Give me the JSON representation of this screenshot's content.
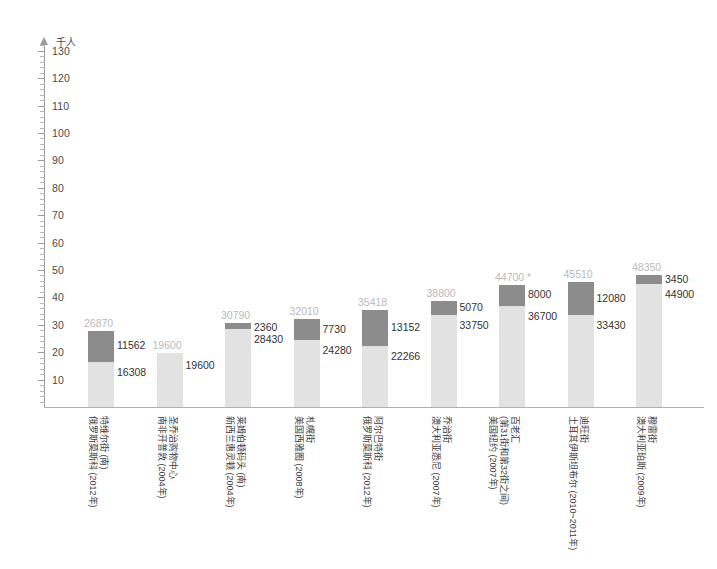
{
  "chart_data": {
    "type": "bar",
    "subtype": "stacked-bar",
    "title": "",
    "xlabel": "",
    "ylabel": "千人",
    "ylim": [
      0,
      135
    ],
    "ytick_labels": [
      "10",
      "20",
      "30",
      "40",
      "50",
      "60",
      "70",
      "80",
      "90",
      "100",
      "110",
      "120",
      "130"
    ],
    "ytick_values": [
      10,
      20,
      30,
      40,
      50,
      60,
      70,
      80,
      90,
      100,
      110,
      120,
      130
    ],
    "grid": false,
    "legend": "none",
    "unit_note": "单位：千人",
    "categories": [
      "特维尔街 / 俄罗斯莫斯科 (2012年)",
      "圣乔治购物中心 / 南非开普敦 (2004年)",
      "莱姆伯顿码头 (南) / 新西兰惠灵顿 (2004年)",
      "札幌街 / 美国西雅图 (2008年)",
      "阿尔巴特街 / 俄罗斯莫斯科 (2012年)",
      "乔治街 / 澳大利亚悉尼 (2007年)",
      "百老汇 (第31街和第32街之间) / 美国纽约 (2007年)",
      "迪旺街 / 土耳其伊斯坦布尔 (2010~2011年)",
      "穆雷街 / 澳大利亚珀斯 (2009年)"
    ],
    "series": [
      {
        "name": "上段",
        "color": "#8c8c8c",
        "values": [
          11562,
          0,
          2360,
          7730,
          13152,
          5070,
          8000,
          12080,
          3450
        ]
      },
      {
        "name": "下段",
        "color": "#e2e2e2",
        "values": [
          16308,
          19600,
          28430,
          24280,
          22266,
          33750,
          36700,
          33430,
          44900
        ]
      }
    ],
    "totals": [
      26870,
      19600,
      30790,
      32010,
      35418,
      38800,
      44700,
      45510,
      48350
    ],
    "total_label_color": "#b9b9b9",
    "annotations": [
      {
        "category_index": 6,
        "text": "*",
        "note": "asterisk next to total 44700"
      }
    ]
  },
  "axis": {
    "unit_label": "千人",
    "arrow_icon": "up-arrow-icon"
  },
  "bars": [
    {
      "name": "bar-tverskaya-moscow",
      "total": "26870",
      "total_suffix": "",
      "top_value": "11562",
      "bottom_value": "16308",
      "label_line1": "特维尔街 (南)",
      "label_line2": "俄罗斯莫斯科 (2012年)"
    },
    {
      "name": "bar-st-georges-capetown",
      "total": "19600",
      "total_suffix": "",
      "top_value": "",
      "bottom_value": "19600",
      "label_line1": "圣乔治购物中心",
      "label_line2": "南非开普敦 (2004年)"
    },
    {
      "name": "bar-lambton-wellington",
      "total": "30790",
      "total_suffix": "",
      "top_value": "2360",
      "bottom_value": "28430",
      "label_line1": "莱姆伯顿码头 (南)",
      "label_line2": "新西兰惠灵顿 (2004年)"
    },
    {
      "name": "bar-sapporo-seattle",
      "total": "32010",
      "total_suffix": "",
      "top_value": "7730",
      "bottom_value": "24280",
      "label_line1": "札幌街",
      "label_line2": "美国西雅图 (2008年)"
    },
    {
      "name": "bar-arbat-moscow",
      "total": "35418",
      "total_suffix": "",
      "top_value": "13152",
      "bottom_value": "22266",
      "label_line1": "阿尔巴特街",
      "label_line2": "俄罗斯莫斯科 (2012年)"
    },
    {
      "name": "bar-george-sydney",
      "total": "38800",
      "total_suffix": "",
      "top_value": "5070",
      "bottom_value": "33750",
      "label_line1": "乔治街",
      "label_line2": "澳大利亚悉尼 (2007年)"
    },
    {
      "name": "bar-broadway-newyork",
      "total": "44700",
      "total_suffix": "*",
      "top_value": "8000",
      "bottom_value": "36700",
      "label_line1": "百老汇",
      "label_line2": "(第31街和第32街之间)",
      "label_line3": "美国纽约 (2007年)"
    },
    {
      "name": "bar-divan-istanbul",
      "total": "45510",
      "total_suffix": "",
      "top_value": "12080",
      "bottom_value": "33430",
      "label_line1": "迪旺街",
      "label_line2": "土耳其伊斯坦布尔 (2010~2011年)"
    },
    {
      "name": "bar-murray-perth",
      "total": "48350",
      "total_suffix": "",
      "top_value": "3450",
      "bottom_value": "44900",
      "label_line1": "穆雷街",
      "label_line2": "澳大利亚珀斯 (2009年)"
    }
  ],
  "colors": {
    "segment_top": "#8c8c8c",
    "segment_bottom": "#e2e2e2",
    "total_text": "#b9b9b9",
    "value_text": "#333333",
    "axis": "#9a9a9a"
  }
}
